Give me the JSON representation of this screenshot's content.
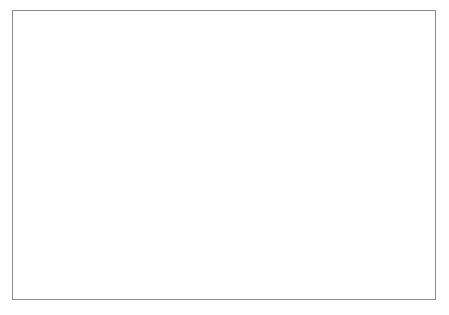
{
  "chart_data": {
    "type": "line",
    "title": "",
    "xlabel": "Year",
    "ylabel": "Number of Events",
    "xlim": [
      1945,
      1986
    ],
    "ylim": [
      0,
      25
    ],
    "grid": false,
    "legend_position": "top-center",
    "x_ticks": [
      "1945",
      "1955",
      "1965",
      "1975",
      "1985"
    ],
    "x_tick_values": [
      1945,
      1955,
      1965,
      1975,
      1985
    ],
    "y_ticks": [
      "0",
      "10",
      "20"
    ],
    "y_tick_values": [
      0,
      10,
      20
    ],
    "y_minor_tick_values": [
      5,
      15,
      25
    ],
    "x": [
      1945,
      1946,
      1947,
      1948,
      1949,
      1950,
      1951,
      1952,
      1953,
      1954,
      1955,
      1956,
      1957,
      1958,
      1959,
      1960,
      1961,
      1962,
      1963,
      1964,
      1965,
      1966,
      1967,
      1968,
      1969,
      1970,
      1971,
      1972,
      1973,
      1974,
      1975,
      1976,
      1977,
      1978,
      1979,
      1980,
      1981,
      1982,
      1983,
      1984,
      1985,
      1986
    ],
    "series": [
      {
        "name": "5 or more deaths",
        "color": "#9a9a9a",
        "values": [
          1,
          1,
          5,
          5,
          0,
          3,
          4,
          2,
          2,
          2,
          2,
          5,
          5,
          5,
          7,
          4,
          5,
          3,
          6,
          5,
          8,
          5,
          6,
          6,
          9,
          9,
          10,
          10,
          10,
          12,
          17,
          13,
          15,
          23,
          14,
          11,
          10,
          11,
          7,
          11,
          10,
          7
        ]
      },
      {
        "name": "25 or more deaths",
        "color": "#141414",
        "values": [
          0,
          0,
          1,
          4,
          0,
          2,
          2,
          0,
          1,
          1,
          0,
          2,
          0,
          0,
          2,
          0,
          2,
          0,
          0,
          2,
          2,
          2,
          1,
          2,
          3,
          2,
          5,
          1,
          2,
          2,
          0,
          4,
          6,
          7,
          8,
          3,
          2,
          3,
          3,
          4,
          6,
          2
        ]
      }
    ],
    "legend": [
      {
        "label": "5 or more deaths",
        "color": "#9a9a9a"
      },
      {
        "label": "25 or more deaths",
        "color": "#141414"
      }
    ]
  }
}
